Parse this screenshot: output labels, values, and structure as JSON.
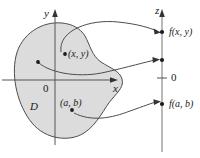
{
  "figure": {
    "kind": "math-diagram",
    "colors": {
      "region_fill": "#dcdcdc",
      "stroke": "#4d4d4d",
      "axis": "#555555",
      "text": "#1a1a1a",
      "background": "#ffffff"
    }
  },
  "xy_plane": {
    "y_axis_label": "y",
    "x_axis_label": "x",
    "origin_label": "0",
    "region_label": "D",
    "points": [
      {
        "name": "point-xy",
        "label": "(x, y)",
        "x": 65,
        "y": 54
      },
      {
        "name": "point-ab",
        "label": "(a, b)",
        "x": 72,
        "y": 110
      },
      {
        "name": "point-unlabeled",
        "label": "",
        "x": 38,
        "y": 62
      }
    ]
  },
  "z_axis": {
    "axis_label": "z",
    "zero_label": "0",
    "values": [
      {
        "name": "value-fxy",
        "label": "f(x, y)",
        "y": 32
      },
      {
        "name": "value-unlabeled",
        "label": "",
        "y": 60
      },
      {
        "name": "value-fab",
        "label": "f(a, b)",
        "y": 104
      }
    ]
  },
  "mappings": [
    {
      "name": "arrow-xy-to-fxy",
      "from": "(x, y)",
      "to": "f(x, y)"
    },
    {
      "name": "arrow-mid",
      "from": "unlabeled point in D",
      "to": "unlabeled point on z-axis"
    },
    {
      "name": "arrow-ab-to-fab",
      "from": "(a, b)",
      "to": "f(a, b)"
    }
  ]
}
